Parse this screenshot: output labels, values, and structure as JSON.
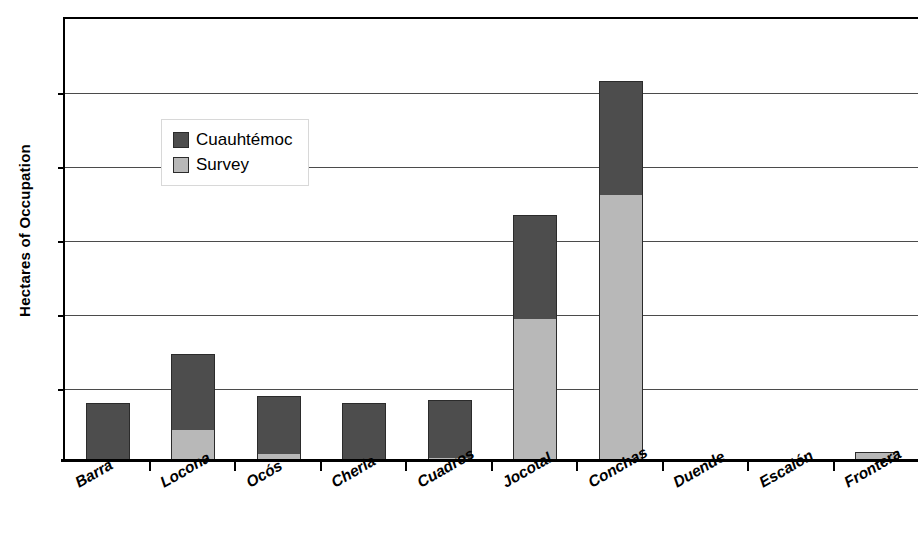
{
  "chart_data": {
    "type": "bar",
    "title": "",
    "subtitle": "",
    "xlabel": "",
    "ylabel": "Hectares of Occupation",
    "stacked": true,
    "grid": true,
    "legend_position": "inside-upper-left",
    "ylim": [
      0,
      30
    ],
    "yticks": [
      0,
      5,
      10,
      15,
      20,
      25,
      30
    ],
    "ytick_labels": [
      "0",
      "5",
      "10",
      "15",
      "20",
      "25",
      "30"
    ],
    "categories": [
      "Barra",
      "Locona",
      "Ocós",
      "Cherla",
      "Cuadros",
      "Jocotal",
      "Conchas",
      "Duende",
      "Escalón",
      "Frontera"
    ],
    "series": [
      {
        "name": "Survey",
        "color": "#b8b8b8",
        "values": [
          0,
          2.1,
          0.5,
          0,
          0.2,
          9.6,
          18.0,
          0,
          0,
          0.6
        ]
      },
      {
        "name": "Cuauhtémoc",
        "color": "#4d4d4d",
        "values": [
          3.9,
          5.1,
          3.9,
          3.9,
          3.9,
          7.0,
          7.7,
          0,
          0,
          0
        ]
      }
    ],
    "totals": [
      3.9,
      7.2,
      4.4,
      3.9,
      4.1,
      16.6,
      25.7,
      0,
      0,
      0.6
    ]
  },
  "legend": {
    "entries": [
      {
        "label": "Cuauhtémoc",
        "color": "#4d4d4d",
        "swatch": "cuauhtemoc"
      },
      {
        "label": "Survey",
        "color": "#b8b8b8",
        "swatch": "survey"
      }
    ]
  },
  "colors": {
    "cuauhtemoc": "#4d4d4d",
    "survey": "#b8b8b8",
    "axis": "#000000",
    "gridline": "#4b4b4b",
    "background": "#ffffff"
  }
}
